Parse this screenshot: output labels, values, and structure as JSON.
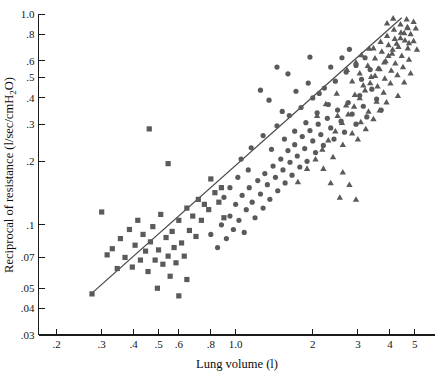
{
  "chart_data": {
    "type": "scatter",
    "title": "",
    "xlabel": "Lung volume (l)",
    "ylabel": "Reciprocal of resistance (l/sec/cmH₂O)",
    "xscale": "log",
    "yscale": "log",
    "xlim": [
      0.17,
      6.0
    ],
    "ylim": [
      0.03,
      1.0
    ],
    "grid": false,
    "legend": "none",
    "xticks": [
      {
        "value": 0.2,
        "label": ".2"
      },
      {
        "value": 0.3,
        "label": ".3"
      },
      {
        "value": 0.4,
        "label": ".4"
      },
      {
        "value": 0.5,
        "label": ".5"
      },
      {
        "value": 0.6,
        "label": ".6"
      },
      {
        "value": 0.8,
        "label": ".8"
      },
      {
        "value": 1.0,
        "label": "1.0"
      },
      {
        "value": 2.0,
        "label": "2"
      },
      {
        "value": 3.0,
        "label": "3"
      },
      {
        "value": 4.0,
        "label": "4"
      },
      {
        "value": 5.0,
        "label": "5"
      }
    ],
    "yticks": [
      {
        "value": 1.0,
        "label": "1.0"
      },
      {
        "value": 0.8,
        "label": ".8"
      },
      {
        "value": 0.6,
        "label": ".6"
      },
      {
        "value": 0.5,
        "label": ".5"
      },
      {
        "value": 0.4,
        "label": ".4"
      },
      {
        "value": 0.3,
        "label": ".3"
      },
      {
        "value": 0.2,
        "label": ".2"
      },
      {
        "value": 0.1,
        "label": ".1"
      },
      {
        "value": 0.07,
        "label": ".07"
      },
      {
        "value": 0.05,
        "label": ".05"
      },
      {
        "value": 0.04,
        "label": ".04"
      },
      {
        "value": 0.03,
        "label": ".03"
      }
    ],
    "fit_line": {
      "name": "regression-line",
      "x0": 0.27,
      "y0": 0.0465,
      "x1": 4.45,
      "y1": 0.96
    },
    "marker_color": "#5a5a5a",
    "series": [
      {
        "name": "squares",
        "marker": "square",
        "points": [
          [
            0.3,
            0.115
          ],
          [
            0.315,
            0.072
          ],
          [
            0.33,
            0.077
          ],
          [
            0.345,
            0.062
          ],
          [
            0.355,
            0.086
          ],
          [
            0.37,
            0.07
          ],
          [
            0.385,
            0.095
          ],
          [
            0.395,
            0.063
          ],
          [
            0.405,
            0.08
          ],
          [
            0.415,
            0.105
          ],
          [
            0.425,
            0.068
          ],
          [
            0.435,
            0.09
          ],
          [
            0.445,
            0.075
          ],
          [
            0.455,
            0.06
          ],
          [
            0.465,
            0.083
          ],
          [
            0.475,
            0.098
          ],
          [
            0.485,
            0.068
          ],
          [
            0.495,
            0.05
          ],
          [
            0.5,
            0.076
          ],
          [
            0.51,
            0.112
          ],
          [
            0.52,
            0.065
          ],
          [
            0.535,
            0.087
          ],
          [
            0.545,
            0.071
          ],
          [
            0.555,
            0.057
          ],
          [
            0.565,
            0.093
          ],
          [
            0.575,
            0.078
          ],
          [
            0.585,
            0.066
          ],
          [
            0.6,
            0.105
          ],
          [
            0.615,
            0.082
          ],
          [
            0.63,
            0.071
          ],
          [
            0.645,
            0.12
          ],
          [
            0.66,
            0.094
          ],
          [
            0.68,
            0.11
          ],
          [
            0.7,
            0.088
          ],
          [
            0.715,
            0.132
          ],
          [
            0.735,
            0.105
          ],
          [
            0.755,
            0.125
          ],
          [
            0.785,
            0.118
          ],
          [
            0.8,
            0.165
          ],
          [
            0.83,
            0.142
          ],
          [
            0.545,
            0.195
          ],
          [
            0.46,
            0.285
          ],
          [
            0.86,
            0.128
          ],
          [
            0.88,
            0.15
          ],
          [
            0.9,
            0.108
          ],
          [
            0.6,
            0.046
          ],
          [
            0.645,
            0.055
          ],
          [
            0.275,
            0.047
          ]
        ]
      },
      {
        "name": "circles",
        "marker": "circle",
        "points": [
          [
            0.8,
            0.09
          ],
          [
            0.85,
            0.078
          ],
          [
            0.88,
            0.1
          ],
          [
            0.92,
            0.086
          ],
          [
            0.95,
            0.11
          ],
          [
            0.98,
            0.095
          ],
          [
            1.0,
            0.125
          ],
          [
            1.03,
            0.105
          ],
          [
            1.06,
            0.138
          ],
          [
            1.08,
            0.092
          ],
          [
            1.1,
            0.118
          ],
          [
            1.13,
            0.15
          ],
          [
            1.16,
            0.128
          ],
          [
            1.19,
            0.108
          ],
          [
            1.22,
            0.162
          ],
          [
            1.25,
            0.14
          ],
          [
            1.28,
            0.12
          ],
          [
            1.3,
            0.175
          ],
          [
            1.33,
            0.155
          ],
          [
            1.36,
            0.132
          ],
          [
            1.4,
            0.19
          ],
          [
            1.43,
            0.168
          ],
          [
            1.46,
            0.145
          ],
          [
            1.5,
            0.205
          ],
          [
            1.53,
            0.182
          ],
          [
            1.56,
            0.158
          ],
          [
            1.6,
            0.225
          ],
          [
            1.63,
            0.198
          ],
          [
            1.66,
            0.172
          ],
          [
            1.7,
            0.24
          ],
          [
            1.74,
            0.212
          ],
          [
            1.78,
            0.188
          ],
          [
            1.82,
            0.262
          ],
          [
            1.86,
            0.23
          ],
          [
            1.9,
            0.2
          ],
          [
            1.95,
            0.28
          ],
          [
            2.0,
            0.25
          ],
          [
            2.05,
            0.22
          ],
          [
            2.1,
            0.3
          ],
          [
            2.15,
            0.268
          ],
          [
            2.2,
            0.238
          ],
          [
            2.28,
            0.32
          ],
          [
            2.35,
            0.288
          ],
          [
            2.42,
            0.255
          ],
          [
            2.5,
            0.35
          ],
          [
            2.58,
            0.31
          ],
          [
            2.66,
            0.275
          ],
          [
            2.75,
            0.38
          ],
          [
            2.85,
            0.335
          ],
          [
            2.95,
            0.3
          ],
          [
            3.05,
            0.41
          ],
          [
            3.15,
            0.365
          ],
          [
            3.25,
            0.325
          ],
          [
            3.4,
            0.44
          ],
          [
            3.55,
            0.395
          ],
          [
            3.7,
            0.35
          ],
          [
            1.05,
            0.205
          ],
          [
            1.15,
            0.232
          ],
          [
            1.28,
            0.265
          ],
          [
            1.45,
            0.295
          ],
          [
            1.62,
            0.33
          ],
          [
            1.8,
            0.36
          ],
          [
            2.0,
            0.4
          ],
          [
            2.22,
            0.445
          ],
          [
            2.45,
            0.48
          ],
          [
            2.7,
            0.53
          ],
          [
            2.95,
            0.57
          ],
          [
            3.2,
            0.62
          ],
          [
            1.35,
            0.39
          ],
          [
            1.52,
            0.345
          ],
          [
            1.72,
            0.43
          ],
          [
            1.92,
            0.47
          ],
          [
            2.12,
            0.42
          ],
          [
            1.6,
            0.52
          ],
          [
            1.45,
            0.56
          ],
          [
            2.35,
            0.56
          ],
          [
            2.6,
            0.62
          ],
          [
            1.95,
            0.625
          ],
          [
            2.78,
            0.68
          ],
          [
            1.25,
            0.435
          ],
          [
            0.95,
            0.15
          ],
          [
            1.02,
            0.168
          ],
          [
            1.12,
            0.182
          ],
          [
            0.9,
            0.135
          ],
          [
            1.38,
            0.228
          ],
          [
            1.55,
            0.255
          ],
          [
            1.7,
            0.278
          ],
          [
            1.88,
            0.305
          ],
          [
            2.08,
            0.34
          ],
          [
            2.3,
            0.372
          ],
          [
            3.1,
            0.49
          ],
          [
            3.35,
            0.545
          ]
        ]
      },
      {
        "name": "triangles",
        "marker": "triangle",
        "points": [
          [
            1.9,
            0.185
          ],
          [
            2.05,
            0.205
          ],
          [
            2.18,
            0.228
          ],
          [
            2.3,
            0.252
          ],
          [
            2.45,
            0.278
          ],
          [
            2.6,
            0.305
          ],
          [
            2.75,
            0.335
          ],
          [
            2.9,
            0.365
          ],
          [
            3.05,
            0.4
          ],
          [
            3.2,
            0.435
          ],
          [
            3.35,
            0.472
          ],
          [
            3.5,
            0.51
          ],
          [
            3.65,
            0.55
          ],
          [
            3.8,
            0.592
          ],
          [
            3.95,
            0.635
          ],
          [
            4.1,
            0.68
          ],
          [
            4.25,
            0.725
          ],
          [
            4.4,
            0.77
          ],
          [
            4.55,
            0.815
          ],
          [
            4.7,
            0.86
          ],
          [
            2.2,
            0.185
          ],
          [
            2.4,
            0.21
          ],
          [
            2.62,
            0.24
          ],
          [
            2.85,
            0.272
          ],
          [
            3.08,
            0.308
          ],
          [
            3.3,
            0.345
          ],
          [
            3.55,
            0.385
          ],
          [
            3.78,
            0.425
          ],
          [
            4.02,
            0.47
          ],
          [
            4.28,
            0.515
          ],
          [
            4.5,
            0.562
          ],
          [
            4.75,
            0.61
          ],
          [
            2.5,
            0.33
          ],
          [
            2.7,
            0.37
          ],
          [
            2.92,
            0.415
          ],
          [
            3.15,
            0.46
          ],
          [
            3.38,
            0.505
          ],
          [
            3.6,
            0.552
          ],
          [
            3.85,
            0.6
          ],
          [
            4.08,
            0.65
          ],
          [
            4.32,
            0.7
          ],
          [
            4.58,
            0.752
          ],
          [
            4.82,
            0.805
          ],
          [
            5.05,
            0.858
          ],
          [
            2.85,
            0.48
          ],
          [
            3.05,
            0.525
          ],
          [
            3.28,
            0.57
          ],
          [
            3.5,
            0.618
          ],
          [
            3.72,
            0.665
          ],
          [
            3.95,
            0.715
          ],
          [
            4.18,
            0.765
          ],
          [
            4.42,
            0.818
          ],
          [
            4.68,
            0.87
          ],
          [
            4.95,
            0.92
          ],
          [
            3.45,
            0.69
          ],
          [
            3.68,
            0.74
          ],
          [
            3.9,
            0.79
          ],
          [
            4.15,
            0.845
          ],
          [
            4.4,
            0.895
          ],
          [
            4.65,
            0.945
          ],
          [
            3.1,
            0.64
          ],
          [
            3.32,
            0.688
          ],
          [
            2.95,
            0.592
          ],
          [
            2.72,
            0.545
          ],
          [
            4.2,
            0.585
          ],
          [
            4.45,
            0.635
          ],
          [
            4.7,
            0.69
          ],
          [
            4.95,
            0.745
          ],
          [
            3.58,
            0.455
          ],
          [
            3.82,
            0.495
          ],
          [
            4.05,
            0.54
          ],
          [
            2.35,
            0.158
          ],
          [
            2.62,
            0.178
          ],
          [
            3.9,
            0.905
          ],
          [
            4.12,
            0.955
          ],
          [
            2.48,
            0.42
          ],
          [
            2.25,
            0.375
          ],
          [
            2.08,
            0.33
          ],
          [
            3.0,
            0.255
          ],
          [
            3.22,
            0.285
          ],
          [
            3.45,
            0.318
          ],
          [
            4.55,
            0.475
          ],
          [
            4.82,
            0.525
          ],
          [
            5.1,
            0.68
          ],
          [
            2.55,
            0.135
          ],
          [
            2.78,
            0.155
          ],
          [
            1.75,
            0.16
          ],
          [
            4.3,
            0.41
          ],
          [
            3.65,
            0.35
          ],
          [
            3.88,
            0.382
          ],
          [
            2.95,
            0.132
          ],
          [
            4.75,
            0.73
          ]
        ]
      }
    ]
  }
}
